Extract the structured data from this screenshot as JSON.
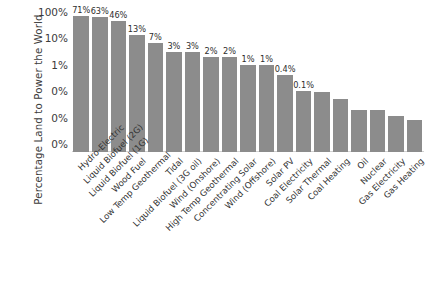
{
  "chart_data": {
    "type": "bar",
    "title": "",
    "subtitle": "",
    "xlabel": "",
    "ylabel": "Percentage Land to Power the World",
    "yscale": "log",
    "ylim": [
      0.0005,
      100
    ],
    "grid": false,
    "legend": null,
    "bar_color": "#8c8c8c",
    "y_ticks": [
      {
        "label": "100%",
        "value": 100
      },
      {
        "label": "10%",
        "value": 10
      },
      {
        "label": "1%",
        "value": 1
      },
      {
        "label": "0%",
        "value": 0.1
      },
      {
        "label": "0%",
        "value": 0.01
      },
      {
        "label": "0%",
        "value": 0.001
      }
    ],
    "categories": [
      "Hydro-Electric",
      "Liquid Biofuel (2G)",
      "Liquid Biofuel (1G)",
      "Wood Fuel",
      "Low Temp Geothermal",
      "Tidal",
      "Liquid Biofuel (3G oil)",
      "Wind (Onshore)",
      "High Temp Geothermal",
      "Concentrating Solar",
      "Wind (Offshore)",
      "Solar PV",
      "Coal Electricity",
      "Solar Thermal",
      "Coal Heating",
      "Oil",
      "Nuclear",
      "Gas Electricity",
      "Gas Heating"
    ],
    "values": [
      71,
      63,
      46,
      13,
      7,
      3,
      3,
      2,
      2,
      1,
      1,
      0.4,
      0.1,
      0.09,
      0.05,
      0.02,
      0.02,
      0.012,
      0.008
    ],
    "data_labels": [
      "71%",
      "63%",
      "46%",
      "13%",
      "7%",
      "3%",
      "3%",
      "2%",
      "2%",
      "1%",
      "1%",
      "0.4%",
      "0.1%",
      "",
      "",
      "",
      "",
      "",
      ""
    ]
  }
}
